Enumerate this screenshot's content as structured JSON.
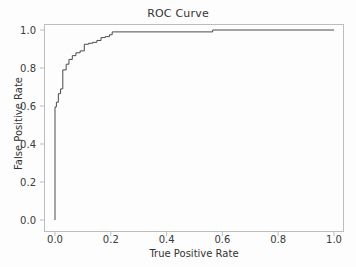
{
  "chart_data": {
    "type": "line",
    "title": "ROC Curve",
    "xlabel": "True Positive Rate",
    "ylabel": "False Positive Rate",
    "xlim": [
      -0.05,
      1.05
    ],
    "ylim": [
      -0.05,
      1.05
    ],
    "grid": false,
    "legend": null,
    "line_color": "#4a4a4a",
    "line_width": 1,
    "drawstyle": "steps-post",
    "xticks": [
      0.0,
      0.2,
      0.4,
      0.6,
      0.8,
      1.0
    ],
    "yticks": [
      0.0,
      0.2,
      0.4,
      0.6,
      0.8,
      1.0
    ],
    "xtick_labels": [
      "0.0",
      "0.2",
      "0.4",
      "0.6",
      "0.8",
      "1.0"
    ],
    "ytick_labels": [
      "0.0",
      "0.2",
      "0.4",
      "0.6",
      "0.8",
      "1.0"
    ],
    "series": [
      {
        "name": "ROC",
        "x": [
          0.0,
          0.0,
          0.005,
          0.005,
          0.012,
          0.012,
          0.02,
          0.02,
          0.028,
          0.028,
          0.04,
          0.04,
          0.05,
          0.05,
          0.062,
          0.062,
          0.075,
          0.075,
          0.09,
          0.09,
          0.105,
          0.105,
          0.12,
          0.12,
          0.135,
          0.135,
          0.15,
          0.15,
          0.165,
          0.165,
          0.18,
          0.18,
          0.195,
          0.195,
          0.205,
          0.205,
          0.565,
          0.565,
          1.0
        ],
        "y": [
          0.0,
          0.595,
          0.595,
          0.62,
          0.62,
          0.665,
          0.665,
          0.69,
          0.69,
          0.79,
          0.79,
          0.82,
          0.82,
          0.845,
          0.845,
          0.865,
          0.865,
          0.88,
          0.88,
          0.89,
          0.89,
          0.925,
          0.925,
          0.93,
          0.93,
          0.935,
          0.935,
          0.945,
          0.945,
          0.96,
          0.96,
          0.965,
          0.965,
          0.975,
          0.975,
          0.99,
          0.99,
          1.0,
          1.0
        ]
      }
    ]
  }
}
